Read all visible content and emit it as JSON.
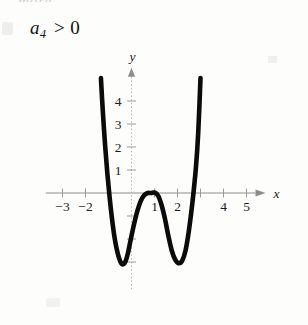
{
  "figure": {
    "caption": {
      "coefficient_symbol": "a",
      "coefficient_subscript": "4",
      "relation": ">",
      "value": "0",
      "full_text": "a4 > 0"
    },
    "scan_bleed_text": "more.",
    "background_color": "#fdfdfc",
    "curve_color": "#0b0b0b",
    "axis_color": "#8d8d8d"
  },
  "chart_data": {
    "type": "line",
    "xlabel": "x",
    "ylabel": "y",
    "xlim": [
      -3.9,
      6.0
    ],
    "ylim": [
      -4.2,
      5.4
    ],
    "grid": false,
    "legend": null,
    "xticks": [
      -3,
      -2,
      -1,
      0,
      1,
      2,
      3,
      4,
      5
    ],
    "xtick_labels": [
      "-3",
      "-2",
      "",
      "",
      "1",
      "2",
      "",
      "4",
      "5"
    ],
    "yticks": [
      -3,
      -2,
      -1,
      0,
      1,
      2,
      3,
      4
    ],
    "ytick_labels": [
      "",
      "",
      "",
      "",
      "1",
      "2",
      "3",
      "4"
    ],
    "annotations": [
      "quartic with positive leading coefficient",
      "W-shaped: two local minima, one local maximum",
      "local maximum at x = 1 is tangent to the x-axis"
    ],
    "series": [
      {
        "name": "quartic",
        "description": "degree-4 polynomial, positive leading coefficient a4 > 0",
        "roots": [
          -1.1,
          1.0,
          2.8
        ],
        "local_minima": [
          {
            "x": -0.35,
            "y": -3.1
          },
          {
            "x": 2.1,
            "y": -3.05
          }
        ],
        "local_maxima": [
          {
            "x": 1.0,
            "y": 0.0
          }
        ],
        "x": [
          -1.33,
          -1.25,
          -1.15,
          -1.05,
          -0.95,
          -0.85,
          -0.75,
          -0.65,
          -0.55,
          -0.45,
          -0.35,
          -0.25,
          -0.15,
          -0.05,
          0.1,
          0.25,
          0.4,
          0.55,
          0.7,
          0.85,
          1.0,
          1.15,
          1.3,
          1.45,
          1.6,
          1.75,
          1.9,
          2.05,
          2.2,
          2.35,
          2.5,
          2.65,
          2.8,
          2.9,
          3.0
        ],
        "y": [
          5.0,
          3.6,
          2.1,
          0.85,
          -0.2,
          -1.1,
          -1.85,
          -2.4,
          -2.8,
          -3.05,
          -3.1,
          -2.95,
          -2.6,
          -2.1,
          -1.4,
          -0.8,
          -0.35,
          -0.1,
          0.0,
          0.0,
          0.02,
          -0.1,
          -0.5,
          -1.1,
          -1.85,
          -2.5,
          -2.9,
          -3.05,
          -2.95,
          -2.5,
          -1.6,
          -0.4,
          1.1,
          2.6,
          5.0
        ]
      }
    ]
  }
}
